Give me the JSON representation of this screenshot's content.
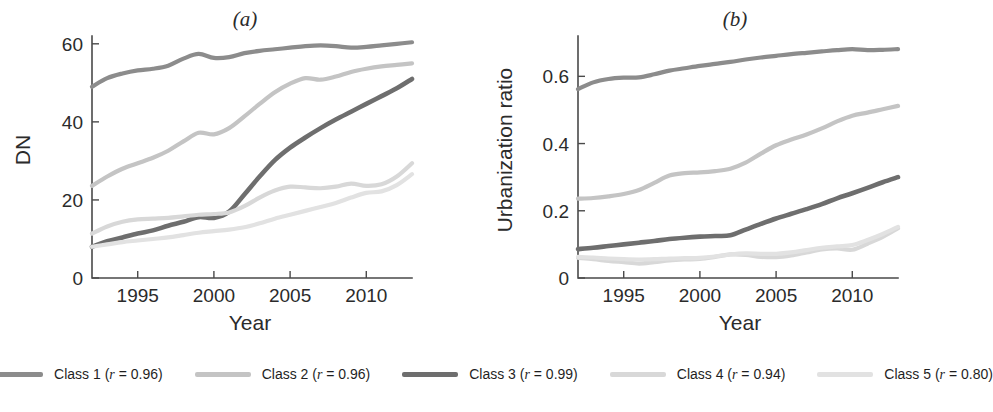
{
  "figure": {
    "width": 980,
    "height": 412,
    "background": "#ffffff"
  },
  "legend": {
    "items": [
      {
        "name": "Class 1",
        "r_prefix": "Class 1 (",
        "r_symbol": "r",
        "r_value": " = 0.96)",
        "color": "#8c8c8c"
      },
      {
        "name": "Class 2",
        "r_prefix": "Class 2 (",
        "r_symbol": "r",
        "r_value": " = 0.96)",
        "color": "#c4c4c4"
      },
      {
        "name": "Class 3",
        "r_prefix": "Class 3 (",
        "r_symbol": "r",
        "r_value": " = 0.99)",
        "color": "#6e6e6e"
      },
      {
        "name": "Class 4",
        "r_prefix": "Class 4 (",
        "r_symbol": "r",
        "r_value": " = 0.94)",
        "color": "#d8d8d8"
      },
      {
        "name": "Class 5",
        "r_prefix": "Class 5 (",
        "r_symbol": "r",
        "r_value": " = 0.80)",
        "color": "#e2e2e2"
      }
    ]
  },
  "chart_data": [
    {
      "id": "panel-a",
      "type": "line",
      "title": "(a)",
      "xlabel": "Year",
      "ylabel": "DN",
      "xlim": [
        1992,
        2013
      ],
      "ylim": [
        0,
        62
      ],
      "xticks": [
        1995,
        2000,
        2005,
        2010
      ],
      "yticks": [
        0,
        20,
        40,
        60
      ],
      "xticklabels": [
        "1995",
        "2000",
        "2005",
        "2010"
      ],
      "yticklabels": [
        "0",
        "20",
        "40",
        "60"
      ],
      "grid": false,
      "legend_position": "below-figure",
      "x": [
        1992,
        1993,
        1994,
        1995,
        1996,
        1997,
        1998,
        1999,
        2000,
        2001,
        2002,
        2003,
        2004,
        2005,
        2006,
        2007,
        2008,
        2009,
        2010,
        2011,
        2012,
        2013
      ],
      "series": [
        {
          "name": "Class 1",
          "color": "#8c8c8c",
          "width": 4.2,
          "values": [
            49.0,
            51.2,
            52.4,
            53.2,
            53.6,
            54.4,
            56.2,
            57.4,
            56.4,
            56.6,
            57.6,
            58.2,
            58.6,
            59.0,
            59.4,
            59.6,
            59.4,
            59.0,
            59.2,
            59.6,
            60.0,
            60.4
          ]
        },
        {
          "name": "Class 2",
          "color": "#c4c4c4",
          "width": 4.2,
          "values": [
            23.6,
            26.0,
            28.0,
            29.4,
            30.8,
            32.6,
            35.0,
            37.2,
            36.8,
            38.4,
            41.4,
            44.6,
            47.6,
            49.8,
            51.2,
            50.8,
            51.6,
            52.8,
            53.6,
            54.2,
            54.6,
            55.0
          ]
        },
        {
          "name": "Class 3",
          "color": "#6e6e6e",
          "width": 4.6,
          "values": [
            8.0,
            9.4,
            10.4,
            11.4,
            12.2,
            13.4,
            14.4,
            15.6,
            15.4,
            17.0,
            21.4,
            26.0,
            30.2,
            33.4,
            36.0,
            38.4,
            40.6,
            42.6,
            44.6,
            46.6,
            48.6,
            51.0
          ]
        },
        {
          "name": "Class 4",
          "color": "#d8d8d8",
          "width": 4.2,
          "values": [
            11.4,
            13.2,
            14.4,
            15.0,
            15.2,
            15.4,
            15.8,
            16.2,
            16.4,
            16.8,
            18.4,
            20.6,
            22.4,
            23.4,
            23.2,
            23.0,
            23.4,
            24.2,
            23.6,
            24.0,
            26.0,
            29.4
          ]
        },
        {
          "name": "Class 5",
          "color": "#e2e2e2",
          "width": 4.2,
          "values": [
            8.0,
            8.6,
            9.2,
            9.6,
            10.0,
            10.4,
            11.0,
            11.6,
            12.0,
            12.4,
            13.0,
            14.0,
            15.2,
            16.2,
            17.2,
            18.2,
            19.2,
            20.6,
            21.8,
            22.2,
            23.8,
            26.6
          ]
        }
      ]
    },
    {
      "id": "panel-b",
      "type": "line",
      "title": "(b)",
      "xlabel": "Year",
      "ylabel": "Urbanization ratio",
      "xlim": [
        1992,
        2013
      ],
      "ylim": [
        0,
        0.72
      ],
      "xticks": [
        1995,
        2000,
        2005,
        2010
      ],
      "yticks": [
        0,
        0.2,
        0.4,
        0.6
      ],
      "xticklabels": [
        "1995",
        "2000",
        "2005",
        "2010"
      ],
      "yticklabels": [
        "0",
        "0.2",
        "0.4",
        "0.6"
      ],
      "grid": false,
      "legend_position": "below-figure",
      "x": [
        1992,
        1993,
        1994,
        1995,
        1996,
        1997,
        1998,
        1999,
        2000,
        2001,
        2002,
        2003,
        2004,
        2005,
        2006,
        2007,
        2008,
        2009,
        2010,
        2011,
        2012,
        2013
      ],
      "series": [
        {
          "name": "Class 1",
          "color": "#8c8c8c",
          "width": 4.2,
          "values": [
            0.562,
            0.582,
            0.592,
            0.596,
            0.597,
            0.606,
            0.617,
            0.624,
            0.631,
            0.637,
            0.643,
            0.65,
            0.656,
            0.661,
            0.666,
            0.67,
            0.674,
            0.678,
            0.681,
            0.678,
            0.679,
            0.681
          ]
        },
        {
          "name": "Class 2",
          "color": "#c4c4c4",
          "width": 4.2,
          "values": [
            0.236,
            0.238,
            0.243,
            0.25,
            0.262,
            0.283,
            0.305,
            0.312,
            0.314,
            0.318,
            0.325,
            0.343,
            0.37,
            0.395,
            0.412,
            0.427,
            0.445,
            0.466,
            0.483,
            0.492,
            0.502,
            0.512
          ]
        },
        {
          "name": "Class 3",
          "color": "#6e6e6e",
          "width": 4.6,
          "values": [
            0.086,
            0.09,
            0.095,
            0.1,
            0.105,
            0.11,
            0.116,
            0.12,
            0.123,
            0.125,
            0.127,
            0.144,
            0.161,
            0.177,
            0.191,
            0.205,
            0.22,
            0.237,
            0.252,
            0.268,
            0.285,
            0.3
          ]
        },
        {
          "name": "Class 4",
          "color": "#d8d8d8",
          "width": 4.2,
          "values": [
            0.06,
            0.056,
            0.051,
            0.047,
            0.043,
            0.047,
            0.052,
            0.055,
            0.057,
            0.063,
            0.07,
            0.069,
            0.063,
            0.062,
            0.067,
            0.076,
            0.085,
            0.088,
            0.084,
            0.102,
            0.122,
            0.148
          ]
        },
        {
          "name": "Class 5",
          "color": "#e2e2e2",
          "width": 4.2,
          "values": [
            0.063,
            0.061,
            0.058,
            0.056,
            0.055,
            0.056,
            0.058,
            0.059,
            0.06,
            0.064,
            0.07,
            0.073,
            0.072,
            0.072,
            0.076,
            0.083,
            0.09,
            0.094,
            0.098,
            0.113,
            0.131,
            0.152
          ]
        }
      ]
    }
  ]
}
